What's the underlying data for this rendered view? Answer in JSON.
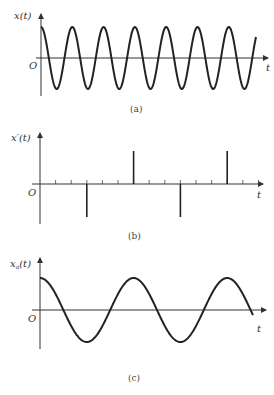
{
  "figure": {
    "panels": [
      {
        "id": "a",
        "ylabel": "x(t)",
        "xlabel": "t",
        "origin_label": "O",
        "caption": "(a)",
        "type": "cosine",
        "amplitude_px": 31,
        "period_px": 31.3,
        "origin": [
          41,
          58
        ],
        "x_end_curve": 256,
        "x_end_axis": 268
      },
      {
        "id": "b",
        "ylabel": "x′(t)",
        "xlabel": "t",
        "origin_label": "O",
        "caption": "(b)",
        "type": "impulse_train",
        "origin": [
          40,
          184
        ],
        "tick_spacing_px": 15.6,
        "tick_count": 14,
        "impulses": [
          {
            "tick_index": 3,
            "value": -1
          },
          {
            "tick_index": 6,
            "value": 1
          },
          {
            "tick_index": 9,
            "value": -1
          },
          {
            "tick_index": 12,
            "value": 1
          }
        ],
        "impulse_height_px": 33,
        "x_end_axis": 263
      },
      {
        "id": "c",
        "ylabel": "xₐ(t)",
        "ylabel_main": "x",
        "ylabel_sub": "a",
        "ylabel_arg": "(t)",
        "xlabel": "t",
        "origin_label": "O",
        "caption": "(c)",
        "type": "cosine",
        "amplitude_px": 32,
        "period_px": 93.6,
        "origin": [
          40,
          310
        ],
        "x_end_curve": 253,
        "x_end_axis": 266
      }
    ]
  }
}
